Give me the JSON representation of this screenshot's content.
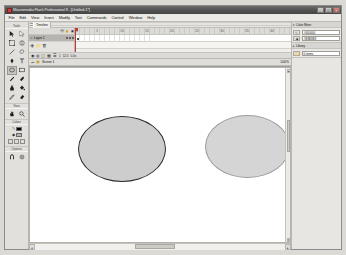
{
  "window": {
    "title": "Macromedia Flash Professional 8 - [Untitled-1*]",
    "app_icon": "flash-app-icon",
    "minimize_label": "_",
    "maximize_label": "□",
    "close_label": "×"
  },
  "menu": {
    "items": [
      {
        "label": "File"
      },
      {
        "label": "Edit"
      },
      {
        "label": "View"
      },
      {
        "label": "Insert"
      },
      {
        "label": "Modify"
      },
      {
        "label": "Text"
      },
      {
        "label": "Commands"
      },
      {
        "label": "Control"
      },
      {
        "label": "Window"
      },
      {
        "label": "Help"
      }
    ]
  },
  "toolbox": {
    "sections": [
      {
        "label": "Tools",
        "tools": [
          {
            "name": "selection-tool",
            "icon": "arrow",
            "selected": false
          },
          {
            "name": "subselection-tool",
            "icon": "white-arrow",
            "selected": false
          },
          {
            "name": "free-transform-tool",
            "icon": "transform",
            "selected": false
          },
          {
            "name": "gradient-transform-tool",
            "icon": "gradient",
            "selected": false
          },
          {
            "name": "line-tool",
            "icon": "line",
            "selected": false
          },
          {
            "name": "lasso-tool",
            "icon": "lasso",
            "selected": false
          },
          {
            "name": "pen-tool",
            "icon": "pen",
            "selected": false
          },
          {
            "name": "text-tool",
            "icon": "letter-a",
            "selected": false
          },
          {
            "name": "oval-tool",
            "icon": "oval",
            "selected": true
          },
          {
            "name": "rectangle-tool",
            "icon": "rectangle",
            "selected": false
          },
          {
            "name": "pencil-tool",
            "icon": "pencil",
            "selected": false
          },
          {
            "name": "brush-tool",
            "icon": "brush",
            "selected": false
          },
          {
            "name": "ink-bottle-tool",
            "icon": "ink-bottle",
            "selected": false
          },
          {
            "name": "paint-bucket-tool",
            "icon": "paint-bucket",
            "selected": false
          },
          {
            "name": "eyedropper-tool",
            "icon": "eyedropper",
            "selected": false
          },
          {
            "name": "eraser-tool",
            "icon": "eraser",
            "selected": false
          }
        ]
      },
      {
        "label": "View",
        "tools": [
          {
            "name": "hand-tool",
            "icon": "hand",
            "selected": false
          },
          {
            "name": "zoom-tool",
            "icon": "magnifier",
            "selected": false
          }
        ]
      },
      {
        "label": "Colors",
        "stroke_color": "#000000",
        "fill_color": "#b3b3b3",
        "stroke_glyph": "✎",
        "fill_glyph": "◆",
        "black-white-button": "bw",
        "no-color-button": "none",
        "swap-colors-button": "swap"
      },
      {
        "label": "Options",
        "tools": [
          {
            "name": "snap-to-objects-option",
            "icon": "magnet",
            "selected": false
          },
          {
            "name": "object-drawing-option",
            "icon": "object-draw",
            "selected": false
          }
        ]
      }
    ]
  },
  "timeline": {
    "panel_title": "Timeline",
    "layer_column": {
      "header_name": "",
      "header_icons": [
        "eye-icon",
        "lock-icon",
        "outline-icon"
      ],
      "layers": [
        {
          "name": "Layer 1",
          "active": true,
          "visible": true,
          "locked": false
        }
      ],
      "buttons": [
        "new-layer-button",
        "new-folder-button",
        "delete-layer-button"
      ]
    },
    "frame_numbers": [
      "1",
      "5",
      "10",
      "15",
      "20",
      "25",
      "30",
      "35",
      "40",
      "45",
      "50",
      "55",
      "60",
      "65",
      "70"
    ],
    "current_frame": "1",
    "status": {
      "controls": [
        "center-frame-button",
        "onion-skin-button",
        "onion-outline-button",
        "edit-multiple-button",
        "modify-onion-markers-button"
      ],
      "frame_indicator": "1",
      "fps": "12.0",
      "elapsed": "0.0s"
    }
  },
  "edit_bar": {
    "back_label": "↩",
    "scene_icon": "scene-icon",
    "scene_name": "Scene 1",
    "zoom_level": "100%"
  },
  "stage": {
    "background_color": "#ffffff",
    "shapes": [
      {
        "name": "ellipse-left",
        "type": "ellipse",
        "fill": "#cdcdcd",
        "stroke": "#2b2b2b",
        "stroke_width": "1.2"
      },
      {
        "name": "ellipse-right",
        "type": "ellipse",
        "fill": "#d5d5d5",
        "stroke": "#9b9b9b",
        "stroke_width": "0.6"
      }
    ]
  },
  "right_dock": {
    "panels": [
      {
        "title": "Color Mixer",
        "arrow": "▾",
        "rows": [
          {
            "icon": "stroke-color-icon",
            "value": "#000000"
          },
          {
            "icon": "fill-color-icon",
            "value": "#B3B3B3"
          }
        ]
      },
      {
        "title": "Library",
        "arrow": "▸",
        "rows": [
          {
            "icon": "library-icon",
            "value": "0 items"
          }
        ]
      }
    ]
  },
  "scrollbars": {
    "left_arrow": "◂",
    "right_arrow": "▸",
    "up_arrow": "▴",
    "down_arrow": "▾"
  }
}
